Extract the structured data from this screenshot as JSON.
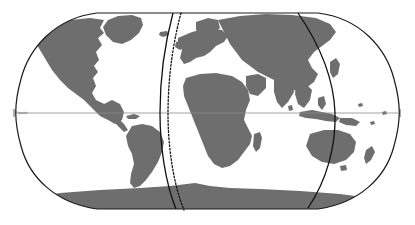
{
  "figure": {
    "kind": "world-map",
    "projection": "Robinson",
    "background_color": "#ffffff"
  },
  "map": {
    "ocean_color": "#ffffff",
    "land_color": "#6e6e6e",
    "graticule_color": "#8a8a8a",
    "border_color": "#1a1a1a",
    "line_color": "#111111",
    "labels": {
      "equator": "Equator"
    }
  },
  "overlays": [
    {
      "id": "meridian-solid-west",
      "style": "solid",
      "color": "#111111"
    },
    {
      "id": "meridian-dotted-west",
      "style": "dotted",
      "color": "#111111"
    },
    {
      "id": "meridian-solid-east",
      "style": "solid",
      "color": "#111111"
    }
  ],
  "graticule": {
    "equator_line": true,
    "equator_y": 113
  }
}
